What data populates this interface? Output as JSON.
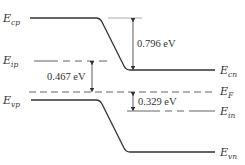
{
  "diagram": {
    "type": "pn-junction-band-diagram",
    "levels": {
      "Ecp": {
        "main": "E",
        "sub": "cp"
      },
      "Eip": {
        "main": "E",
        "sub": "ip"
      },
      "Evp": {
        "main": "E",
        "sub": "vp"
      },
      "Ecn": {
        "main": "E",
        "sub": "cn"
      },
      "EF": {
        "main": "E",
        "sub": "F"
      },
      "Ein": {
        "main": "E",
        "sub": "in"
      },
      "Evn": {
        "main": "E",
        "sub": "vn"
      }
    },
    "annotations": {
      "barrier": "0.796 eV",
      "p_side": "0.467 eV",
      "n_side": "0.329 eV"
    },
    "colors": {
      "line": "#333333",
      "thin": "#777777"
    }
  }
}
